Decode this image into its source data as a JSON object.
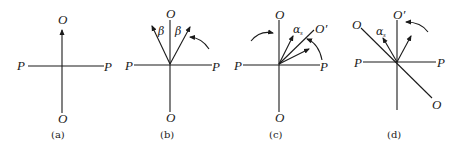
{
  "figure": {
    "panels": [
      {
        "caption": "(a)",
        "labels": {
          "top": "O",
          "bottom": "O",
          "left": "P",
          "right": "P"
        }
      },
      {
        "caption": "(b)",
        "labels": {
          "top": "O",
          "bottom": "O",
          "left": "P",
          "right": "P",
          "angle_left": "β",
          "angle_right": "β"
        }
      },
      {
        "caption": "(c)",
        "labels": {
          "top": "O",
          "bottom": "O",
          "left": "P",
          "right": "P",
          "rotated_axis": "O′",
          "angle": "α",
          "angle_sub": "s"
        }
      },
      {
        "caption": "(d)",
        "labels": {
          "top": "O′",
          "upper_left": "O",
          "lower_right": "O",
          "left": "P",
          "right": "P",
          "angle": "α",
          "angle_sub": "s"
        }
      }
    ]
  }
}
